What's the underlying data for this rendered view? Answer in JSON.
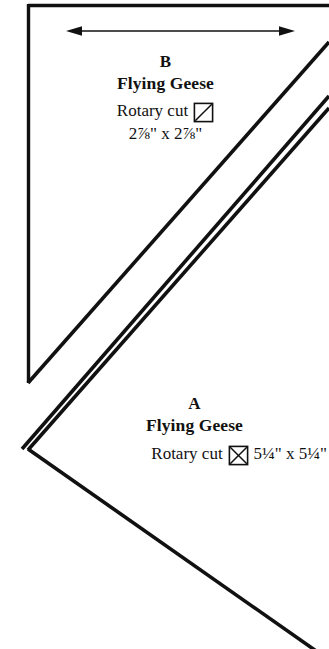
{
  "document": {
    "kind": "quilting-pattern-cutting-diagram",
    "background_color": "#ffffff",
    "ink_color": "#111111"
  },
  "arrow": {
    "name": "width-dimension-arrow",
    "style": "double-headed",
    "orientation": "horizontal"
  },
  "pieces": [
    {
      "id": "b",
      "letter": "B",
      "name": "Flying Geese",
      "cut_label": "Rotary cut",
      "icon": "square-single-diagonal-icon",
      "icon_type": "half-square-triangle",
      "dimensions": "2⅞\" x 2⅞\"",
      "dimensions_inline": false
    },
    {
      "id": "a",
      "letter": "A",
      "name": "Flying Geese",
      "cut_label": "Rotary cut",
      "icon": "square-double-diagonal-icon",
      "icon_type": "quarter-square-triangle",
      "dimensions": "5¼\" x 5¼\"",
      "dimensions_inline": true
    }
  ],
  "geometry": {
    "line_color": "#111111",
    "top_edge": "horizontal-top-border",
    "left_edge": "vertical-left-border",
    "diagonals": "parallel-45-degree-cut-lines",
    "chevron": "triangle-a-left-vertex"
  }
}
